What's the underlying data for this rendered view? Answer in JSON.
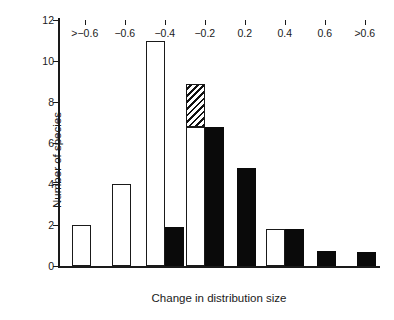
{
  "chart_data": {
    "type": "bar",
    "title": "",
    "subtitle": "",
    "xlabel": "Change in distribution size",
    "ylabel": "Number of species",
    "categories": [
      ">−0.6",
      "−0.6",
      "−0.4",
      "−0.2",
      "0.2",
      "0.4",
      "0.6",
      ">0.6"
    ],
    "ylim": [
      0,
      12
    ],
    "yticks": [
      0,
      2,
      4,
      6,
      8,
      10,
      12
    ],
    "ytick_labels": [
      "0",
      "2",
      "4",
      "6",
      "8",
      "10",
      "12"
    ],
    "grid": false,
    "legend_position": "none",
    "series": [
      {
        "name": "open",
        "style": "open-outline",
        "color": "#ffffff",
        "edge_color": "#1a1a1a",
        "values": [
          2,
          4,
          11,
          6.8,
          0,
          1.8,
          0,
          0
        ]
      },
      {
        "name": "hatched-overlay",
        "style": "diagonal-hatch",
        "color": "#1a1a1a",
        "edge_color": "#1a1a1a",
        "note": "stacked on top of the open bar in the −0.2 bin, from 6.8 to 8.9",
        "values": [
          0,
          0,
          0,
          8.9,
          0,
          0,
          0,
          0
        ],
        "base_values": [
          0,
          0,
          0,
          6.8,
          0,
          0,
          0,
          0
        ]
      },
      {
        "name": "filled",
        "style": "solid-black",
        "color": "#0a0a0a",
        "edge_color": "#0a0a0a",
        "values": [
          0,
          0,
          1.9,
          6.8,
          4.8,
          1.8,
          0.75,
          0.7
        ]
      }
    ],
    "annotations": []
  }
}
